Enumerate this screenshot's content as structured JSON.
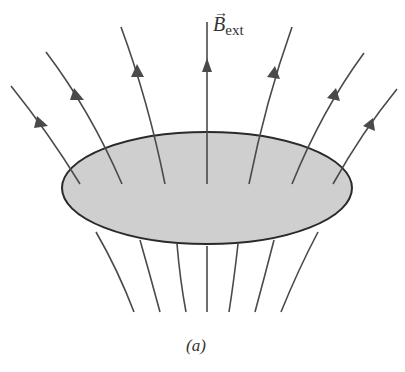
{
  "figure": {
    "field_label": {
      "symbol": "B",
      "subscript": "ext",
      "vector_arrow": "→"
    },
    "caption": "(a)",
    "colors": {
      "disk_fill": "#cfcfcf",
      "disk_stroke": "#2a2a2a",
      "field_lines": "#4a4a4a",
      "background": "#ffffff"
    },
    "disk": {
      "cx": 207,
      "cy": 188,
      "rx": 145,
      "ry": 56
    },
    "field_line_count_above": 7,
    "field_line_count_below": 7
  }
}
